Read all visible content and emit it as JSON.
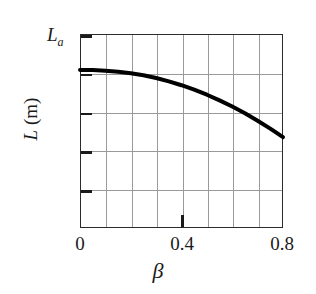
{
  "chart_data": {
    "type": "line",
    "title": "",
    "xlabel": "β",
    "ylabel": "L (m)",
    "ylabel_symbol": "L",
    "ylabel_unit": "(m)",
    "xlim": [
      0,
      0.8
    ],
    "ylim": [
      0,
      1
    ],
    "grid": true,
    "legend": null,
    "x_tick_labels": [
      "0",
      "0.4",
      "0.8"
    ],
    "x_tick_values": [
      0,
      0.4,
      0.8
    ],
    "y_tick_labels": [
      "L_a",
      "",
      "",
      "",
      ""
    ],
    "y_top_annotation": "La",
    "y_top_annotation_symbol": "L",
    "y_top_annotation_sub": "a",
    "x_minor_divisions": 8,
    "y_minor_divisions": 5,
    "series": [
      {
        "name": "L vs beta",
        "color": "#000000",
        "linewidth": 4,
        "x": [
          0.0,
          0.05,
          0.1,
          0.15,
          0.2,
          0.25,
          0.3,
          0.35,
          0.4,
          0.45,
          0.5,
          0.55,
          0.6,
          0.65,
          0.7,
          0.75,
          0.8
        ],
        "y": [
          0.815,
          0.814,
          0.811,
          0.806,
          0.798,
          0.787,
          0.773,
          0.756,
          0.736,
          0.713,
          0.687,
          0.658,
          0.626,
          0.591,
          0.553,
          0.512,
          0.468
        ]
      }
    ]
  },
  "figure": {
    "background": "#ffffff",
    "frame_color": "#2b2b2b",
    "grid_color": "#9a9a9a",
    "curve_color": "#000000"
  }
}
